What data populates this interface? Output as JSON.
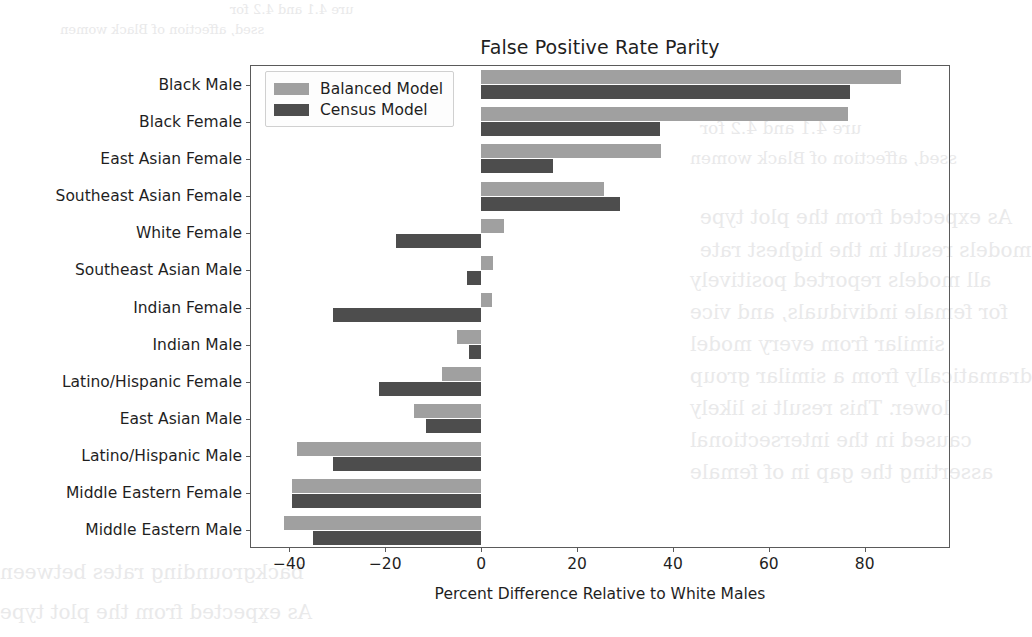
{
  "chart_data": {
    "type": "bar",
    "orientation": "horizontal",
    "title": "False Positive Rate Parity",
    "xlabel": "Percent Difference Relative to White Males",
    "ylabel": "",
    "xlim": [
      -48,
      98
    ],
    "xticks": [
      -40,
      -20,
      0,
      20,
      40,
      60,
      80
    ],
    "xtick_labels": [
      "−40",
      "−20",
      "0",
      "20",
      "40",
      "60",
      "80"
    ],
    "grid": false,
    "legend_position": "upper left",
    "categories": [
      "Black Male",
      "Black Female",
      "East Asian Female",
      "Southeast Asian Female",
      "White Female",
      "Southeast Asian Male",
      "Indian Female",
      "Indian Male",
      "Latino/Hispanic Female",
      "East Asian Male",
      "Latino/Hispanic Male",
      "Middle Eastern Female",
      "Middle Eastern Male"
    ],
    "series": [
      {
        "name": "Balanced Model",
        "color": "#a0a0a0",
        "values": [
          87.5,
          76.5,
          37.5,
          25.7,
          4.7,
          2.4,
          2.2,
          -5.1,
          -8.2,
          -14.0,
          -38.5,
          -39.4,
          -41.2
        ]
      },
      {
        "name": "Census Model",
        "color": "#4d4d4d",
        "values": [
          77.0,
          37.3,
          14.9,
          29.0,
          -17.8,
          -3.0,
          -31.0,
          -2.6,
          -21.2,
          -11.5,
          -31.0,
          -39.4,
          -35.1
        ]
      }
    ]
  },
  "legend": {
    "entries": [
      {
        "label": "Balanced Model",
        "swatch_color": "#a0a0a0"
      },
      {
        "label": "Census Model",
        "swatch_color": "#4d4d4d"
      }
    ]
  },
  "colors": {
    "balanced_model": "#a0a0a0",
    "census_model": "#4d4d4d",
    "axis": "#5a5a5a",
    "text": "#1f1f1f",
    "background": "#ffffff"
  },
  "background_artifacts": {
    "lines": [
      "ure 4.1 and 4.2 for",
      "ssed, affection of Black women",
      "As expected from the plot type",
      "models result in the highest rate",
      "all models reported positively",
      "for female individuals, and vice",
      "similar from every model",
      "dramatically from a similar group",
      "lower. This result is likely",
      "caused in the intersectional",
      "asserting the gap in of female",
      "backgrounding rates between"
    ]
  }
}
